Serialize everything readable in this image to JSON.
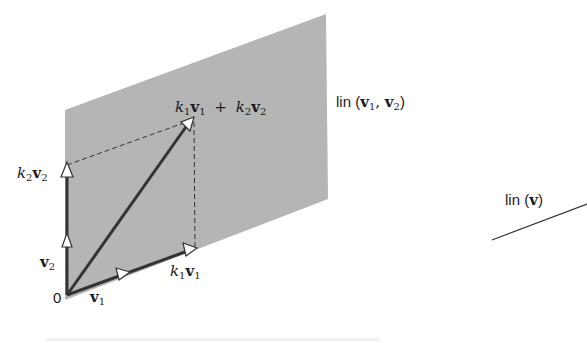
{
  "figure": {
    "plane": {
      "name": "lin (v1, v2)",
      "color": "#b5b5b5",
      "corners": [
        [
          65,
          110
        ],
        [
          326,
          14
        ],
        [
          328,
          199
        ],
        [
          65,
          300
        ]
      ]
    },
    "vectors": {
      "origin": [
        67,
        295
      ],
      "v1_tip": [
        128,
        272
      ],
      "k1v1_tip": [
        195,
        248
      ],
      "v2_tip": [
        67,
        238
      ],
      "k2v2_tip": [
        67,
        165
      ],
      "sum_tip": [
        192,
        120
      ]
    },
    "labels": {
      "origin": "0",
      "v1": {
        "sym": "v",
        "sub": "1"
      },
      "v2": {
        "sym": "v",
        "sub": "2"
      },
      "k1v1": {
        "k": "k",
        "ksub": "1",
        "sym": "v",
        "sub": "1"
      },
      "k2v2": {
        "k": "k",
        "ksub": "2",
        "sym": "v",
        "sub": "2"
      },
      "sum": {
        "plus": "+"
      },
      "plane_label": {
        "prefix": "lin (",
        "comma": ", ",
        "suffix": ")"
      },
      "line_label": {
        "prefix": "lin (",
        "sym": "v",
        "suffix": ")"
      }
    },
    "line": {
      "name": "lin (v)",
      "from": [
        492,
        240
      ],
      "to": [
        587,
        204
      ],
      "color": "#333333"
    },
    "stroke_color": "#333333"
  }
}
